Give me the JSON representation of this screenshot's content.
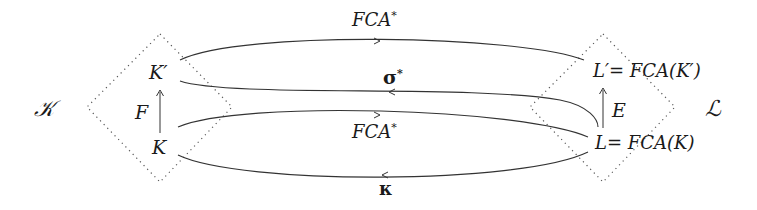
{
  "diagram": {
    "left_set": {
      "name": "𝒦",
      "top_node": "K′",
      "bottom_node": "K",
      "up_arrow_label": "F"
    },
    "right_set": {
      "name": "ℒ",
      "top_node": "L′= FCA(K′)",
      "bottom_node": "L= FCA(K)",
      "up_arrow_label": "E"
    },
    "edges": [
      {
        "label": "FCA",
        "sup": "*",
        "from": "K′",
        "to": "L′",
        "direction": "right"
      },
      {
        "label": "σ",
        "sup": "*",
        "from": "L",
        "to": "K′",
        "direction": "left"
      },
      {
        "label": "FCA",
        "sup": "*",
        "from": "K",
        "to": "L",
        "direction": "right"
      },
      {
        "label": "κ",
        "sup": "",
        "from": "L",
        "to": "K",
        "direction": "left"
      }
    ],
    "colors": {
      "line": "#333333",
      "dotted": "#555555",
      "text": "#1a1a1a"
    }
  }
}
